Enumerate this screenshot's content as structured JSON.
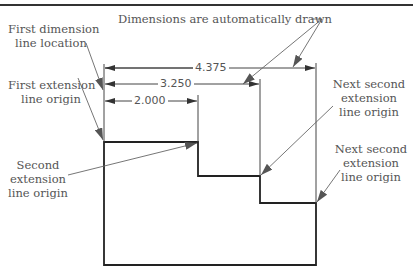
{
  "diagram": {
    "labels": {
      "first_dim_line_1": "First dimension",
      "first_dim_line_2": "line location",
      "auto_drawn": "Dimensions are automatically drawn",
      "first_ext_1": "First extension",
      "first_ext_2": "line origin",
      "second_ext_1": "Second",
      "second_ext_2": "extension",
      "second_ext_3": "line origin",
      "next_second_a_1": "Next second",
      "next_second_a_2": "extension",
      "next_second_a_3": "line origin",
      "next_second_b_1": "Next second",
      "next_second_b_2": "extension",
      "next_second_b_3": "line origin"
    },
    "dimensions": {
      "d1": "2.000",
      "d2": "3.250",
      "d3": "4.375"
    },
    "colors": {
      "shape": "#222222",
      "dim_lines": "#444444",
      "leaders": "#666666",
      "text": "#555555"
    }
  }
}
